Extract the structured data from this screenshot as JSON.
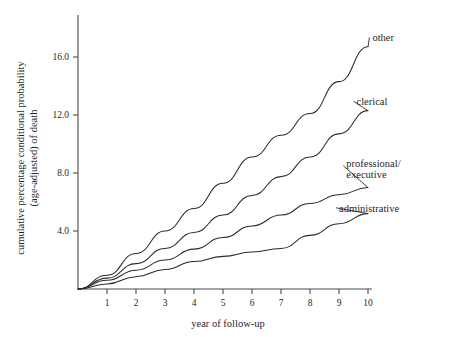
{
  "chart_data": {
    "type": "line",
    "title": "",
    "xlabel": "year of follow-up",
    "ylabel": "cumulative percentage conditional probability (age-adjusted) of death",
    "ylabel_line1": "cumulative percentage conditional probability",
    "ylabel_line2": "(age-adjusted) of death",
    "x": [
      0,
      1,
      2,
      3,
      4,
      5,
      6,
      7,
      8,
      9,
      10
    ],
    "xlim": [
      0,
      10.3
    ],
    "ylim": [
      0,
      18.0
    ],
    "xticks": [
      1,
      2,
      3,
      4,
      5,
      6,
      7,
      8,
      9,
      10
    ],
    "xticklabels": [
      "1",
      "2",
      "3",
      "4",
      "5",
      "6",
      "7",
      "8",
      "9",
      "10"
    ],
    "yticks": [
      4.0,
      8.0,
      12.0,
      16.0
    ],
    "yticklabels": [
      "4.0",
      "8.0",
      "12.0",
      "16.0"
    ],
    "grid": false,
    "legend": "inline-labels-right",
    "series": [
      {
        "name": "other",
        "label": "other",
        "values": [
          0.0,
          0.95,
          2.45,
          4.0,
          5.55,
          7.3,
          9.1,
          10.6,
          12.1,
          14.3,
          16.7
        ],
        "label_x": 10.05,
        "label_y": 17.35
      },
      {
        "name": "clerical",
        "label": "clerical",
        "values": [
          0.0,
          0.75,
          1.75,
          2.8,
          3.9,
          5.1,
          6.45,
          7.75,
          9.1,
          10.7,
          12.3
        ],
        "label_x": 9.5,
        "label_y": 12.95
      },
      {
        "name": "professional-executive",
        "label": "professional/ executive",
        "label_line1": "professional/",
        "label_line2": "executive",
        "values": [
          0.0,
          0.6,
          1.3,
          2.0,
          2.75,
          3.55,
          4.35,
          5.1,
          5.9,
          6.5,
          7.0
        ],
        "label_x": 9.15,
        "label_y": 8.5
      },
      {
        "name": "administrative",
        "label": "administrative",
        "values": [
          0.0,
          0.35,
          0.85,
          1.35,
          1.9,
          2.25,
          2.55,
          2.8,
          3.7,
          4.5,
          5.2
        ],
        "label_x": 8.9,
        "label_y": 5.6
      }
    ]
  },
  "colors": {
    "curve": "#2b2b2b",
    "axis": "#4a4a4a",
    "text": "#1f1f1f",
    "background": "#ffffff"
  }
}
